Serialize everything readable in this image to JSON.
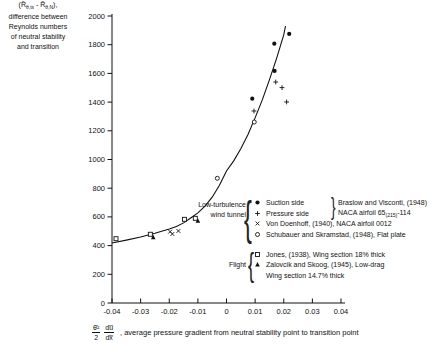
{
  "chart_data": {
    "type": "scatter",
    "title": "",
    "xlim": [
      -0.04,
      0.04
    ],
    "ylim": [
      0,
      2000
    ],
    "grid": false,
    "x_ticks": [
      -0.04,
      -0.03,
      -0.02,
      -0.01,
      0,
      0.01,
      0.02,
      0.03,
      0.04
    ],
    "x_tick_labels": [
      "-0.04",
      "-0.03",
      "-0.02",
      "-0.01",
      "0",
      "0.01",
      "0.02",
      "0.03",
      "0.04"
    ],
    "y_ticks": [
      0,
      200,
      400,
      600,
      800,
      1000,
      1200,
      1400,
      1600,
      1800,
      2000
    ],
    "y_tick_labels": [
      "0",
      "200",
      "400",
      "600",
      "800",
      "1000",
      "1200",
      "1400",
      "1600",
      "1800",
      "2000"
    ],
    "ylabel_formula": {
      "p1": "(R̃",
      "s1": "θ,ts",
      "p2": " - R̃",
      "s2": "θ,N",
      "p3": "),"
    },
    "ylabel_lines": [
      "difference between",
      "Reynolds numbers",
      "of neutral stability",
      "and transition"
    ],
    "xlabel_frac1_num": "θ̄²",
    "xlabel_frac1_den": "2",
    "xlabel_frac2_num": "du̅",
    "xlabel_frac2_den": "dx̅",
    "xlabel_text": ", average pressure gradient from neutral stability point to transition point",
    "curve": [
      [
        -0.04,
        418
      ],
      [
        -0.035,
        438
      ],
      [
        -0.03,
        460
      ],
      [
        -0.025,
        486
      ],
      [
        -0.02,
        515
      ],
      [
        -0.0175,
        533
      ],
      [
        -0.015,
        558
      ],
      [
        -0.0125,
        592
      ],
      [
        -0.01,
        628
      ],
      [
        -0.0075,
        675
      ],
      [
        -0.005,
        737
      ],
      [
        -0.0025,
        818
      ],
      [
        0,
        920
      ],
      [
        0.0025,
        990
      ],
      [
        0.005,
        1075
      ],
      [
        0.0075,
        1175
      ],
      [
        0.01,
        1290
      ],
      [
        0.0125,
        1415
      ],
      [
        0.015,
        1555
      ],
      [
        0.0175,
        1705
      ],
      [
        0.02,
        1870
      ],
      [
        0.0206,
        1930
      ]
    ],
    "series": [
      {
        "name": "Suction side, Braslow and Visconti, (1948), NACA airfoil 65(215)-114",
        "marker": "circle-filled",
        "points": [
          [
            0.009,
            1424
          ],
          [
            0.0167,
            1807
          ],
          [
            0.0168,
            1617
          ],
          [
            0.0219,
            1875
          ]
        ]
      },
      {
        "name": "Pressure side, Braslow and Visconti, (1948), NACA airfoil 65(215)-114",
        "marker": "plus",
        "points": [
          [
            0.0096,
            1338
          ],
          [
            0.0172,
            1540
          ],
          [
            0.0194,
            1501
          ],
          [
            0.021,
            1401
          ]
        ]
      },
      {
        "name": "Von Doenhoff, (1940), NACA airfoil 0012",
        "marker": "x",
        "points": [
          [
            -0.0197,
            497
          ],
          [
            -0.0189,
            481
          ],
          [
            -0.0168,
            502
          ]
        ]
      },
      {
        "name": "Schubauer and Skramstad, (1948), Flat plate",
        "marker": "circle-open",
        "points": [
          [
            -0.0032,
            869
          ],
          [
            0.0097,
            1261
          ]
        ]
      },
      {
        "name": "Jones, (1938), Wing section 18% thick",
        "marker": "square-open",
        "points": [
          [
            -0.0386,
            448
          ],
          [
            -0.0266,
            479
          ],
          [
            -0.0147,
            583
          ],
          [
            -0.0109,
            590
          ]
        ]
      },
      {
        "name": "Zalovcik and Skoog, (1945), Low-drag Wing section 14.7% thick",
        "marker": "triangle-filled",
        "points": [
          [
            -0.0256,
            458
          ],
          [
            -0.01,
            574
          ]
        ]
      }
    ],
    "legend_position": "center-right"
  },
  "legend": {
    "brace_open": "{",
    "brace_close": "}",
    "wind_tunnel": {
      "label_lines": [
        "Low-turbulence",
        "wind tunnel"
      ],
      "items": [
        {
          "marker": "circle-filled",
          "text": "Suction side"
        },
        {
          "marker": "plus",
          "text": "Pressure side"
        },
        {
          "marker": "x",
          "text": "Von Doenhoff, (1940), NACA airfoil 0012"
        },
        {
          "marker": "circle-open",
          "text": "Schubauer and Skramstad, (1948), Flat plate"
        }
      ],
      "ref_line1": "Braslow and Visconti, (1948)",
      "ref_line2_pre": "NACA airfoil 65",
      "ref_line2_sub": "(215)",
      "ref_line2_post": "-114"
    },
    "flight": {
      "label": "Flight",
      "items": [
        {
          "marker": "square-open",
          "text": "Jones, (1938), Wing section 18% thick"
        },
        {
          "marker": "triangle-filled",
          "text": "Zalovcik and Skoog, (1945), Low-drag"
        },
        {
          "marker": "none",
          "text": "Wing section 14.7% thick"
        }
      ]
    }
  },
  "colors": {
    "ink": "#111111",
    "background": "#ffffff"
  }
}
